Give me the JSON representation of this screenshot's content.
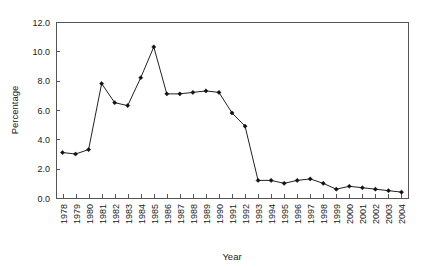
{
  "chart_data": {
    "type": "line",
    "title": "",
    "xlabel": "Year",
    "ylabel": "Percentage",
    "categories": [
      "1978",
      "1979",
      "1980",
      "1981",
      "1982",
      "1983",
      "1984",
      "1985",
      "1986",
      "1987",
      "1988",
      "1989",
      "1990",
      "1991",
      "1992",
      "1993",
      "1994",
      "1995",
      "1996",
      "1997",
      "1998",
      "1999",
      "2000",
      "2001",
      "2002",
      "2003",
      "2004"
    ],
    "values": [
      3.1,
      3.0,
      3.3,
      7.8,
      6.5,
      6.3,
      8.2,
      10.3,
      7.1,
      7.1,
      7.2,
      7.3,
      7.2,
      5.8,
      4.9,
      1.2,
      1.2,
      1.0,
      1.2,
      1.3,
      1.0,
      0.6,
      0.8,
      0.7,
      0.6,
      0.5,
      0.4
    ],
    "ylim": [
      0.0,
      12.0
    ],
    "ytick_labels": [
      "0.0",
      "2.0",
      "4.0",
      "6.0",
      "8.0",
      "10.0",
      "12.0"
    ],
    "ytick_values": [
      0.0,
      2.0,
      4.0,
      6.0,
      8.0,
      10.0,
      12.0
    ],
    "grid": false,
    "legend": "none",
    "marker": "filled-diamond",
    "line_color": "#222222",
    "marker_color": "#111111",
    "axis_color": "#555555"
  }
}
